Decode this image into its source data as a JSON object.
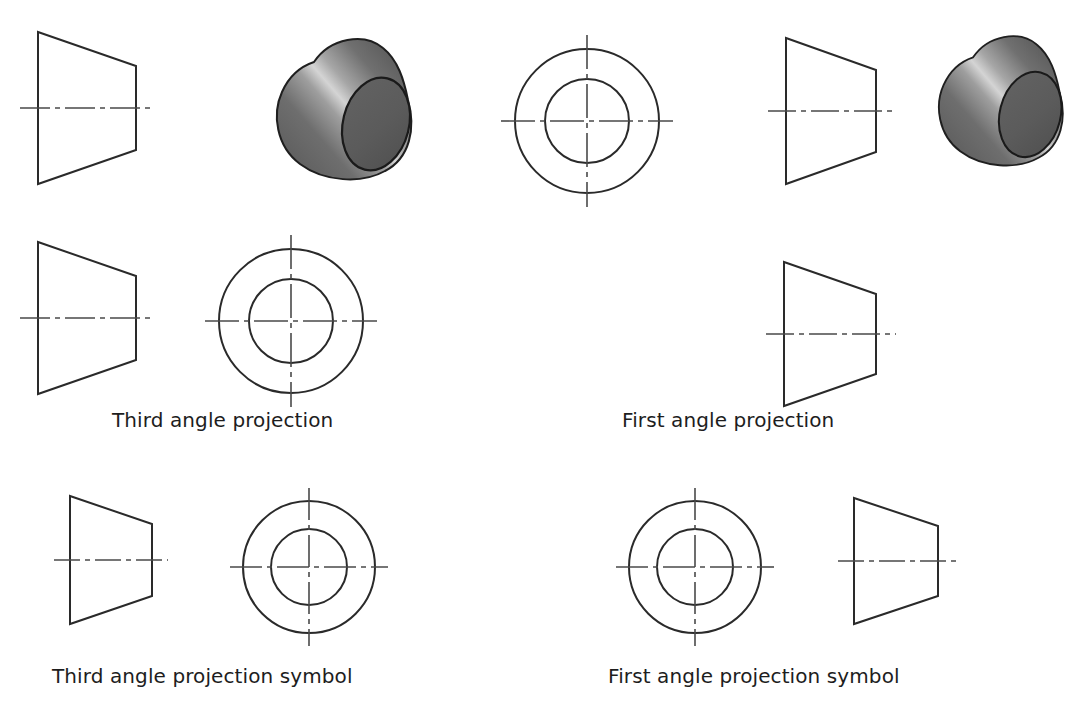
{
  "page": {
    "background": "#ffffff",
    "line_color": "#2a2a2a",
    "centerline_color": "#4a4a4a",
    "solid_base_color": "#6b6b6b",
    "solid_highlight_color": "#d2d2d2",
    "solid_dark_color": "#555555"
  },
  "captions": {
    "third_angle_projection": "Third angle projection",
    "first_angle_projection": "First angle projection",
    "third_angle_symbol": "Third angle projection symbol",
    "first_angle_symbol": "First angle projection symbol"
  },
  "panels": [
    {
      "id": "third-angle-projection",
      "caption": "Third angle projection",
      "views": [
        {
          "name": "front-view-trapezoid",
          "shape": "trapezoid",
          "orientation": "long-left"
        },
        {
          "name": "pictorial-view-frustum",
          "shape": "frustum-3d"
        },
        {
          "name": "top-view-trapezoid",
          "shape": "trapezoid",
          "orientation": "long-left"
        },
        {
          "name": "end-view-circles",
          "shape": "concentric-circles"
        }
      ]
    },
    {
      "id": "first-angle-projection",
      "caption": "First angle projection",
      "views": [
        {
          "name": "end-view-circles",
          "shape": "concentric-circles"
        },
        {
          "name": "front-view-trapezoid",
          "shape": "trapezoid",
          "orientation": "long-left"
        },
        {
          "name": "pictorial-view-frustum",
          "shape": "frustum-3d"
        },
        {
          "name": "lower-view-trapezoid",
          "shape": "trapezoid",
          "orientation": "short-left"
        }
      ]
    },
    {
      "id": "third-angle-projection-symbol",
      "caption": "Third angle projection symbol",
      "views": [
        {
          "name": "symbol-trapezoid",
          "shape": "trapezoid",
          "orientation": "long-left"
        },
        {
          "name": "symbol-circles",
          "shape": "concentric-circles"
        }
      ]
    },
    {
      "id": "first-angle-projection-symbol",
      "caption": "First angle projection symbol",
      "views": [
        {
          "name": "symbol-circles",
          "shape": "concentric-circles"
        },
        {
          "name": "symbol-trapezoid",
          "shape": "trapezoid",
          "orientation": "short-left"
        }
      ]
    }
  ]
}
